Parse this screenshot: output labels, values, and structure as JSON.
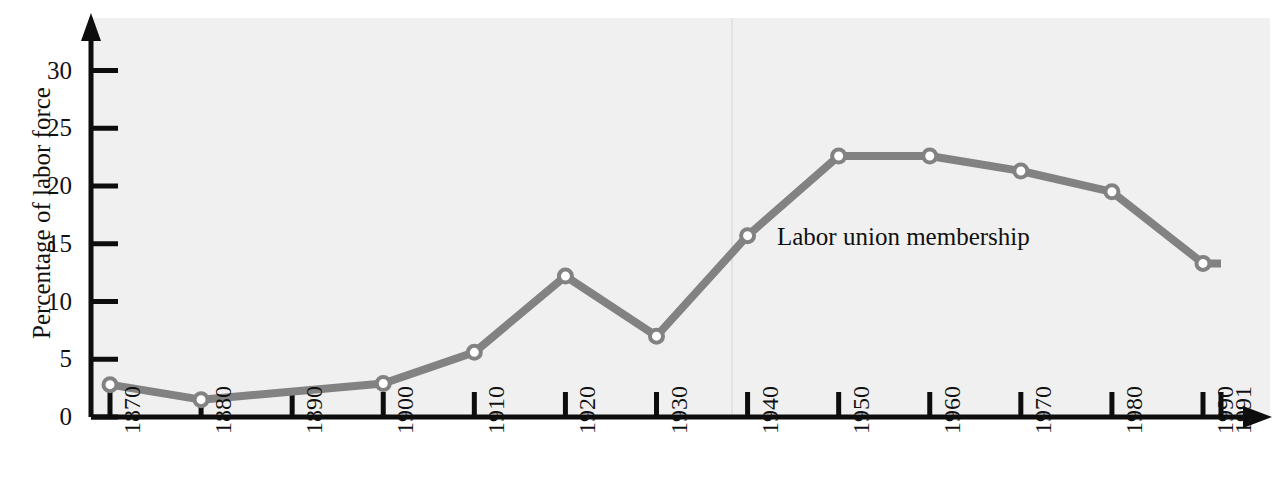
{
  "chart_data": {
    "type": "line",
    "title": "",
    "subtitle": "",
    "xlabel": "",
    "ylabel": "Percentage of labor force",
    "xlim": [
      1870,
      1991
    ],
    "ylim": [
      0,
      32
    ],
    "grid": false,
    "legend_position": "inline-annotation",
    "annotations": [
      {
        "text": "Labor union membership",
        "x": 1946,
        "y": 15.5
      }
    ],
    "y_ticks": [
      0,
      5,
      10,
      15,
      20,
      25,
      30
    ],
    "y_tick_labels": [
      "0",
      "5",
      "10",
      "15",
      "20",
      "25",
      "30"
    ],
    "x_ticks": [
      1870,
      1880,
      1890,
      1900,
      1910,
      1920,
      1930,
      1940,
      1950,
      1960,
      1970,
      1980,
      1990,
      1991
    ],
    "x_tick_labels": [
      "1870",
      "1880",
      "1890",
      "1900",
      "1910",
      "1920",
      "1930",
      "1940",
      "1950",
      "1960",
      "1970",
      "1980",
      "1990",
      "1991"
    ],
    "series": [
      {
        "name": "Labor union membership",
        "color": "#828282",
        "marker": "circle-open",
        "x": [
          1870,
          1880,
          1900,
          1910,
          1920,
          1930,
          1940,
          1950,
          1960,
          1970,
          1980,
          1990,
          1991
        ],
        "values": [
          2.8,
          1.5,
          2.9,
          5.6,
          12.2,
          7.0,
          15.7,
          22.6,
          22.6,
          21.3,
          19.5,
          13.3,
          13.3
        ]
      }
    ]
  },
  "axes": {
    "y_axis_arrow": "up-arrow-icon",
    "x_axis_arrow": "right-arrow-icon"
  },
  "colors": {
    "line": "#828282",
    "axis": "#0d0d0d",
    "plot_background": "#f0f0f0",
    "marker_fill": "#ffffff",
    "text": "#111111"
  }
}
